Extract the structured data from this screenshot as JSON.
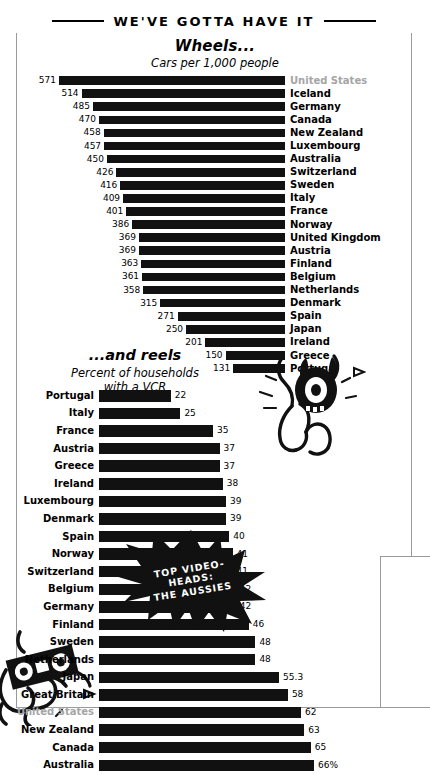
{
  "header": {
    "title": "WE'VE GOTTA HAVE IT"
  },
  "chart1_head": {
    "title": "Wheels...",
    "subtitle": "Cars per 1,000 people"
  },
  "chart2_head": {
    "title": "...and reels",
    "subtitle_line1": "Percent of households",
    "subtitle_line2": "with a VCR"
  },
  "starburst": {
    "line1": "TOP VIDEO-",
    "line2": "HEADS:",
    "line3": "THE AUSSIES"
  },
  "colors": {
    "bar": "#111111",
    "highlight_label": "#a5a5a5",
    "frame": "#9a9a9a",
    "text": "#000000"
  },
  "icons": {
    "tire_creature": "tire-headed-creature-illustration",
    "cassette_creature": "cassette-headed-creature-illustration",
    "starburst": "starburst-badge-icon"
  },
  "chart_data": [
    {
      "type": "bar",
      "orientation": "horizontal",
      "title": "Wheels...",
      "subtitle": "Cars per 1,000 people",
      "xlabel": "",
      "ylabel": "",
      "xlim": [
        0,
        571
      ],
      "grid": false,
      "legend": "none",
      "value_suffix": "",
      "categories": [
        "United States",
        "Iceland",
        "Germany",
        "Canada",
        "New Zealand",
        "Luxembourg",
        "Australia",
        "Switzerland",
        "Sweden",
        "Italy",
        "France",
        "Norway",
        "United Kingdom",
        "Austria",
        "Finland",
        "Belgium",
        "Netherlands",
        "Denmark",
        "Spain",
        "Japan",
        "Ireland",
        "Greece",
        "Portugal"
      ],
      "values": [
        571,
        514,
        485,
        470,
        458,
        457,
        450,
        426,
        416,
        409,
        401,
        386,
        369,
        369,
        363,
        361,
        358,
        315,
        271,
        250,
        201,
        150,
        131
      ],
      "highlight": [
        "United States"
      ]
    },
    {
      "type": "bar",
      "orientation": "horizontal",
      "title": "...and reels",
      "subtitle": "Percent of households with a VCR",
      "xlabel": "",
      "ylabel": "",
      "xlim": [
        0,
        66
      ],
      "grid": false,
      "legend": "none",
      "value_suffix": "%",
      "categories": [
        "Portugal",
        "Italy",
        "France",
        "Austria",
        "Greece",
        "Ireland",
        "Luxembourg",
        "Denmark",
        "Spain",
        "Norway",
        "Switzerland",
        "Belgium",
        "Germany",
        "Finland",
        "Sweden",
        "Netherlands",
        "Japan",
        "Great Britain",
        "United States",
        "New Zealand",
        "Canada",
        "Australia"
      ],
      "values": [
        22,
        25,
        35,
        37,
        37,
        38,
        39,
        39,
        40,
        41,
        41,
        42,
        42,
        46,
        48,
        48,
        55.3,
        58,
        62,
        63,
        65,
        66
      ],
      "value_labels": [
        "22",
        "25",
        "35",
        "37",
        "37",
        "38",
        "39",
        "39",
        "40",
        "41",
        "41",
        "42",
        "42",
        "46",
        "48",
        "48",
        "55.3",
        "58",
        "62",
        "63",
        "65",
        "66%"
      ],
      "highlight": [
        "United States"
      ]
    }
  ]
}
